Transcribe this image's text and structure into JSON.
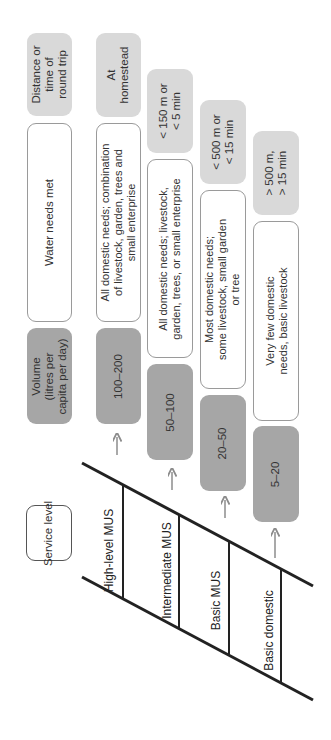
{
  "header": {
    "distance": "Distance or\ntime of\nround trip",
    "water_needs": "Water needs met",
    "volume": "Volume\n(litres per\ncapita per day)",
    "service_level": "Service level"
  },
  "levels": [
    {
      "service_level": "High-level MUS",
      "volume": "100–200",
      "water_needs": "All domestic needs; combination\nof livestock, garden, trees and\nsmall enterprise",
      "distance": "At\nhomestead"
    },
    {
      "service_level": "Intermediate MUS",
      "volume": "50–100",
      "water_needs": "All domestic needs; livestock,\ngarden, trees, or small enterprise",
      "distance": "< 150 m or\n< 5 min"
    },
    {
      "service_level": "Basic MUS",
      "volume": "20–50",
      "water_needs": "Most domestic needs;\nsome livestock, small garden\nor tree",
      "distance": "< 500 m or\n< 15 min"
    },
    {
      "service_level": "Basic domestic",
      "volume": "5–20",
      "water_needs": "Very few domestic\nneeds, basic livestock",
      "distance": "> 500 m,\n> 15 min"
    }
  ],
  "colors": {
    "distance_fill": "#d9d9d9",
    "volume_fill": "#a6a6a6",
    "needs_border": "#9a9a9a",
    "ladder": "#222222",
    "arrow": "#8c8c8c"
  }
}
